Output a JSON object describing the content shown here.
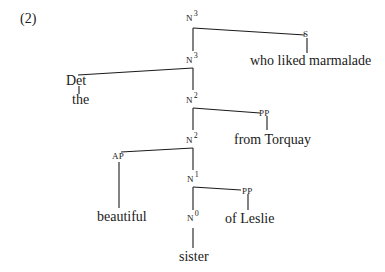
{
  "example_number": "(2)",
  "tree": {
    "nodes": {
      "n3_top": {
        "cat": "N",
        "bar": "3"
      },
      "s": {
        "cat": "S"
      },
      "s_text": "who liked marmalade",
      "n3_mid": {
        "cat": "N",
        "bar": "3"
      },
      "det": "Det",
      "det_text": "the",
      "n2_top": {
        "cat": "N",
        "bar": "2"
      },
      "pp1": {
        "cat": "PP"
      },
      "pp1_text": "from Torquay",
      "n2_mid": {
        "cat": "N",
        "bar": "2"
      },
      "ap": {
        "cat": "AP"
      },
      "ap_text": "beautiful",
      "n1": {
        "cat": "N",
        "bar": "1"
      },
      "pp2": {
        "cat": "PP"
      },
      "pp2_text": "of Leslie",
      "n0": {
        "cat": "N",
        "bar": "0"
      },
      "n0_text": "sister"
    }
  },
  "colors": {
    "line": "#1a1a1a",
    "text": "#1a1a1a",
    "background": "#ffffff"
  }
}
